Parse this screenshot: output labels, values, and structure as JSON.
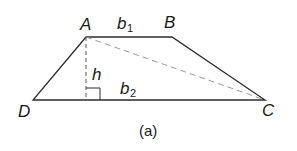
{
  "figure": {
    "caption": "(a)",
    "shape": "trapezoid",
    "vertices": {
      "A": {
        "label": "A",
        "x": 86,
        "y": 37
      },
      "B": {
        "label": "B",
        "x": 172,
        "y": 37
      },
      "C": {
        "label": "C",
        "x": 265,
        "y": 100
      },
      "D": {
        "label": "D",
        "x": 33,
        "y": 100
      }
    },
    "labels": {
      "top_base": "b",
      "top_base_sub": "1",
      "bottom_base": "b",
      "bottom_base_sub": "2",
      "height": "h"
    },
    "colors": {
      "solid_line": "#2b2b2b",
      "dashed_line": "#9a9a9a",
      "height_line": "#555555"
    }
  }
}
